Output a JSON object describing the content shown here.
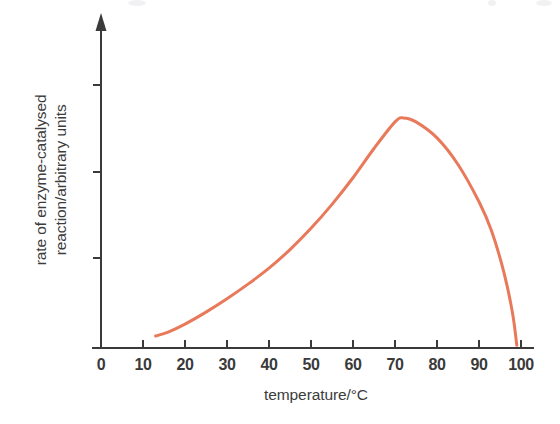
{
  "chart_data": {
    "type": "line",
    "title": "",
    "subtitle": "",
    "xlabel": "temperature/°C",
    "ylabel": "rate of enzyme-catalysed reaction/arbitrary units",
    "ylabel_lines": [
      "rate of enzyme-catalysed",
      "reaction/arbitrary units"
    ],
    "xlim": [
      0,
      100
    ],
    "ylim": [
      0,
      100
    ],
    "xticks": [
      0,
      10,
      20,
      30,
      40,
      50,
      60,
      70,
      80,
      90,
      100
    ],
    "xtick_labels": [
      "0",
      "10",
      "20",
      "30",
      "40",
      "50",
      "60",
      "70",
      "80",
      "90",
      "100"
    ],
    "yticks": [
      25,
      50,
      75
    ],
    "ytick_labels": [
      "",
      "",
      ""
    ],
    "grid": false,
    "legend": false,
    "legend_position": "none",
    "axis_color": "#3a3a3a",
    "series": [
      {
        "name": "rate of enzyme-catalysed reaction",
        "color": "#e8795a",
        "line_width": 3,
        "x": [
          13,
          16,
          20,
          25,
          30,
          35,
          40,
          45,
          50,
          55,
          60,
          65,
          70,
          72,
          75,
          80,
          85,
          90,
          93,
          96,
          98,
          99
        ],
        "y": [
          4.5,
          6,
          9,
          13.5,
          18.5,
          24,
          30,
          37,
          45,
          54,
          64,
          75,
          85,
          86.5,
          85,
          79,
          69,
          55,
          44,
          28,
          13,
          1
        ]
      }
    ],
    "annotations": [
      {
        "label": "peak",
        "x": 72,
        "y": 86.5
      }
    ]
  },
  "axes": {
    "y_arrow": "arrow-up",
    "x_axis_name": "x-axis-line",
    "y_axis_name": "y-axis-line"
  }
}
